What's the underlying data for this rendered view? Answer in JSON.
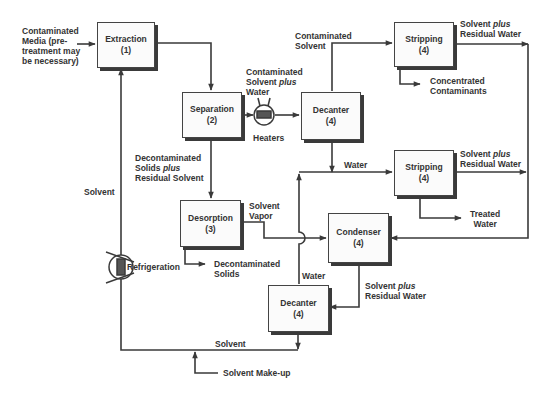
{
  "diagram": {
    "units": {
      "extraction": {
        "name": "Extraction",
        "num": "(1)"
      },
      "separation": {
        "name": "Separation",
        "num": "(2)"
      },
      "decanter_top": {
        "name": "Decanter",
        "num": "(4)"
      },
      "stripping_top": {
        "name": "Stripping",
        "num": "(4)"
      },
      "stripping_mid": {
        "name": "Stripping",
        "num": "(4)"
      },
      "desorption": {
        "name": "Desorption",
        "num": "(3)"
      },
      "condenser": {
        "name": "Condenser",
        "num": "(4)"
      },
      "decanter_bottom": {
        "name": "Decanter",
        "num": "(4)"
      }
    },
    "labels": {
      "contaminated_media_1": "Contaminated",
      "contaminated_media_2": "Media (pre-",
      "contaminated_media_3": "treatment may",
      "contaminated_media_4": "be necessary)",
      "contaminated_solvent_1": "Contaminated",
      "contaminated_solvent_2": "Solvent",
      "cont_solvent_water_1": "Contaminated",
      "cont_solvent_water_2a": "Solvent ",
      "cont_solvent_water_2b": "plus",
      "cont_solvent_water_3": "Water",
      "heaters": "Heaters",
      "solvent_residual_top_1a": "Solvent ",
      "solvent_residual_top_1b": "plus",
      "solvent_residual_top_2": "Residual Water",
      "concentrated_1": "Concentrated",
      "concentrated_2": "Contaminants",
      "water_top": "Water",
      "solvent_residual_mid_1a": "Solvent ",
      "solvent_residual_mid_1b": "plus",
      "solvent_residual_mid_2": "Residual Water",
      "treated_1": "Treated",
      "treated_2": "Water",
      "decon_solids_solvent_1": "Decontaminated",
      "decon_solids_solvent_2a": "Solids ",
      "decon_solids_solvent_2b": "plus",
      "decon_solids_solvent_3": "Residual Solvent",
      "solvent_left": "Solvent",
      "solvent_vapor_1": "Solvent",
      "solvent_vapor_2": "Vapor",
      "refrigeration": "Refrigeration",
      "decon_solids_1": "Decontaminated",
      "decon_solids_2": "Solids",
      "water_bottom": "Water",
      "solvent_residual_bot_1a": "Solvent ",
      "solvent_residual_bot_1b": "plus",
      "solvent_residual_bot_2": "Residual Water",
      "solvent_bottom": "Solvent",
      "solvent_makeup": "Solvent Make-up"
    },
    "colors": {
      "line": "#3a3a3a",
      "text": "#333333",
      "box_fill": "#fbfbfb",
      "shadow": "#3a3a3a"
    }
  }
}
